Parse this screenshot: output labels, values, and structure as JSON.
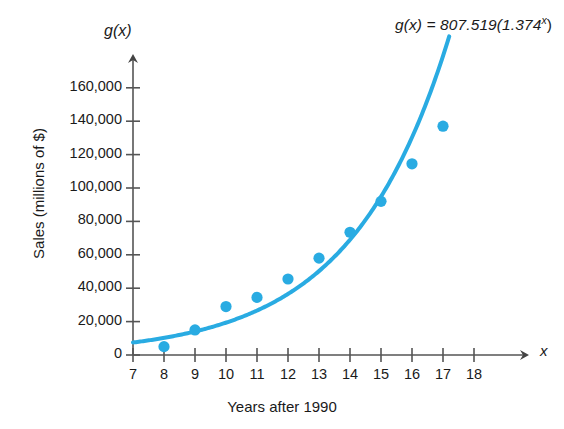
{
  "chart_data": {
    "type": "scatter",
    "title": "",
    "equation_label": "g(x) = 807.519(1.374",
    "equation_exponent": "x",
    "equation_close": ")",
    "function_axis_label": "g(x)",
    "x_axis_arrow_label": "x",
    "xlabel": "Years after 1990",
    "ylabel": "Sales (millions of $)",
    "xlim": [
      7,
      18
    ],
    "ylim": [
      0,
      170000
    ],
    "xticks": [
      7,
      8,
      9,
      10,
      11,
      12,
      13,
      14,
      15,
      16,
      17,
      18
    ],
    "xtick_labels": [
      "7",
      "8",
      "9",
      "10",
      "11",
      "12",
      "13",
      "14",
      "15",
      "16",
      "17",
      "18"
    ],
    "yticks": [
      0,
      20000,
      40000,
      60000,
      80000,
      100000,
      120000,
      140000,
      160000
    ],
    "ytick_labels": [
      "0",
      "20,000",
      "40,000",
      "60,000",
      "80,000",
      "100,000",
      "120,000",
      "140,000",
      "160,000"
    ],
    "grid": false,
    "legend": "none",
    "series": [
      {
        "name": "Sales data",
        "type": "scatter",
        "color": "#29ABE2",
        "x": [
          8,
          9,
          10,
          11,
          12,
          13,
          14,
          15,
          16,
          17
        ],
        "values": [
          5000,
          15000,
          29000,
          34500,
          45500,
          58000,
          73500,
          92000,
          114500,
          137000
        ]
      },
      {
        "name": "Exponential model g(x) = 807.519(1.374^x)",
        "type": "line",
        "color": "#29ABE2",
        "model_a": 807.519,
        "model_b": 1.374,
        "x_range": [
          7,
          17.2
        ]
      }
    ]
  },
  "colors": {
    "accent_blue": "#29ABE2",
    "axis": "#555555",
    "text": "#1a1a1a",
    "background": "#ffffff"
  }
}
